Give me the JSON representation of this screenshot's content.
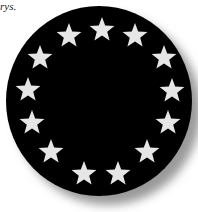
{
  "caption": {
    "text": "rys."
  },
  "emblem": {
    "description": "Black circular emblem with a ring of 13 white stars",
    "star_count": 13,
    "colors": {
      "disc": "#000000",
      "star": "#e6e6e6",
      "shadow": "#9a9a9a",
      "background": "#ffffff"
    },
    "stars": [
      {
        "x": 69,
        "y": 36,
        "r": 13
      },
      {
        "x": 102,
        "y": 30,
        "r": 13
      },
      {
        "x": 135,
        "y": 36,
        "r": 13
      },
      {
        "x": 164,
        "y": 58,
        "r": 13
      },
      {
        "x": 172,
        "y": 91,
        "r": 13
      },
      {
        "x": 168,
        "y": 123,
        "r": 13
      },
      {
        "x": 147,
        "y": 152,
        "r": 13
      },
      {
        "x": 118,
        "y": 174,
        "r": 13
      },
      {
        "x": 84,
        "y": 174,
        "r": 13
      },
      {
        "x": 51,
        "y": 152,
        "r": 13
      },
      {
        "x": 32,
        "y": 123,
        "r": 13
      },
      {
        "x": 28,
        "y": 90,
        "r": 13
      },
      {
        "x": 40,
        "y": 58,
        "r": 13
      }
    ]
  }
}
